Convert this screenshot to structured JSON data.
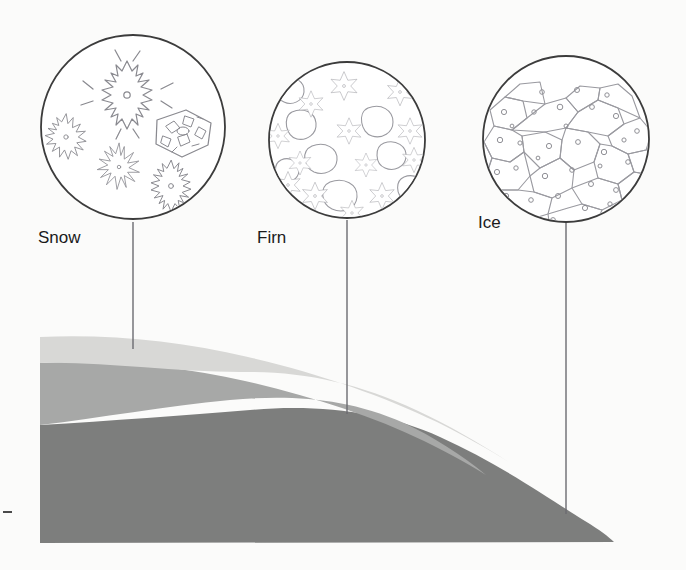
{
  "figure": {
    "background_color": "#fbfbfa",
    "line_color": "#6e6e72",
    "circle_stroke_color": "#3c3c3c",
    "leader_line_color": "#6b6b70",
    "label_color": "#1a1a1a"
  },
  "callouts": [
    {
      "id": "snow",
      "label": "Snow",
      "label_x": 38,
      "label_y": 243,
      "circle": {
        "cx": 133,
        "cy": 127,
        "r": 92
      },
      "leader": {
        "x": 133,
        "y_top": 222,
        "y_bottom": 349
      },
      "crystal_type": "dendritic-snowflakes",
      "description": "Freshly fallen six-armed dendritic snow crystals plus one rimed plate"
    },
    {
      "id": "firn",
      "label": "Firn",
      "label_x": 257,
      "label_y": 243,
      "circle": {
        "cx": 347,
        "cy": 140,
        "r": 78
      },
      "leader": {
        "x": 347,
        "y_top": 220,
        "y_bottom": 414
      },
      "crystal_type": "rounded-granular-grains",
      "description": "Partly rounded granular grains with remnant star arms, bonded together"
    },
    {
      "id": "ice",
      "label": "Ice",
      "label_x": 478,
      "label_y": 228,
      "circle": {
        "cx": 566,
        "cy": 139,
        "r": 83
      },
      "leader": {
        "x": 566,
        "y_top": 222,
        "y_bottom": 514
      },
      "crystal_type": "interlocking-polygonal-crystals",
      "description": "Large interlocking polygonal ice crystals with trapped air bubbles"
    }
  ],
  "glacier": {
    "layers": [
      {
        "id": "snow-layer",
        "name": "Snow",
        "color": "#d8d8d6"
      },
      {
        "id": "firn-layer",
        "name": "Firn",
        "color": "#a7a8a7"
      },
      {
        "id": "ice-layer",
        "name": "Ice",
        "color": "#7d7e7d"
      }
    ],
    "left_edge_x": 40,
    "base_y": 543,
    "crest_y": 337,
    "toe_x": 614
  },
  "left_tick": {
    "x": 3,
    "y": 512,
    "width": 9
  }
}
